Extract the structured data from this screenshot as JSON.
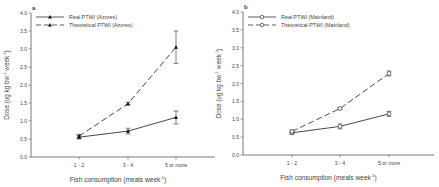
{
  "chart_data": [
    {
      "type": "line",
      "panel_label": "a",
      "title": "",
      "xlabel": "Fish consumption (meals week⁻¹)",
      "ylabel": "Dose (µg kg bw⁻¹ week⁻¹)",
      "ylim": [
        0,
        4.0
      ],
      "yticks": [
        "0.0",
        "0.5",
        "1.0",
        "1.5",
        "2.0",
        "2.5",
        "3.0",
        "3.5",
        "4.0"
      ],
      "categories": [
        "1 - 2",
        "3 - 4",
        "5 or more"
      ],
      "legend_position": "top-left",
      "series": [
        {
          "name": "Real PTWI (Azores)",
          "marker": "filled-triangle",
          "linestyle": "solid",
          "values": [
            0.55,
            0.72,
            1.1
          ],
          "errors": [
            0.05,
            0.08,
            0.18
          ]
        },
        {
          "name": "Theoretical PTWI (Azores)",
          "marker": "filled-triangle",
          "linestyle": "dashed",
          "values": [
            0.58,
            1.48,
            3.05
          ],
          "errors": [
            0.05,
            0.04,
            0.45
          ]
        }
      ]
    },
    {
      "type": "line",
      "panel_label": "b",
      "title": "",
      "xlabel": "Fish consumption (meals week⁻¹)",
      "ylabel": "Dose (µg kg bw⁻¹ week⁻¹)",
      "ylim": [
        0,
        4.0
      ],
      "yticks": [
        "0.0",
        "0.5",
        "1.0",
        "1.5",
        "2.0",
        "2.5",
        "3.0",
        "3.5",
        "4.0"
      ],
      "categories": [
        "1 - 2",
        "3 - 4",
        "5 or more"
      ],
      "legend_position": "top-left",
      "series": [
        {
          "name": "Real PTWI (Mainland)",
          "marker": "open-circle",
          "linestyle": "solid",
          "values": [
            0.62,
            0.8,
            1.15
          ],
          "errors": [
            0.04,
            0.07,
            0.07
          ]
        },
        {
          "name": "Theoretical PTWI (Mainland)",
          "marker": "open-circle",
          "linestyle": "dashed",
          "values": [
            0.66,
            1.3,
            2.28
          ],
          "errors": [
            0.04,
            0.03,
            0.07
          ]
        }
      ]
    }
  ],
  "panels": {
    "a": {
      "label": "a",
      "legend": [
        "Real PTWI (Azores)",
        "Theoretical PTWI (Azores)"
      ],
      "xlabel": "Fish consumption (meals week",
      "xlabel_sup": "-1",
      "xlabel_end": ")",
      "ylabel_pre": "Dose (ug kg bw",
      "ylabel_sup1": "-1",
      "ylabel_mid": " week",
      "ylabel_sup2": "-1",
      "ylabel_end": ")"
    },
    "b": {
      "label": "b",
      "legend": [
        "Real PTWI (Mainland)",
        "Theoretical PTWI (Mainland)"
      ],
      "xlabel": "Fish consumption (meals week",
      "xlabel_sup": "-1",
      "xlabel_end": ")",
      "ylabel_pre": "Dose (ug kg bw",
      "ylabel_sup1": "-1",
      "ylabel_mid": " week",
      "ylabel_sup2": "-1",
      "ylabel_end": ")"
    }
  },
  "colors": {
    "axis": "#555555",
    "line": "#333333",
    "text": "#444444"
  }
}
